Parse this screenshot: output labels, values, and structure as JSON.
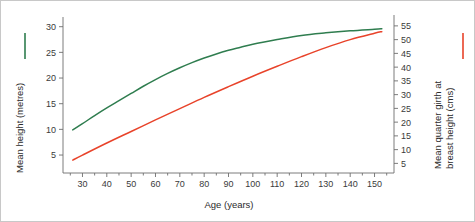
{
  "chart_data": {
    "type": "line",
    "title": "",
    "xlabel": "Age (years)",
    "xlim": [
      22,
      158
    ],
    "xticks": [
      30,
      40,
      50,
      60,
      70,
      80,
      90,
      100,
      110,
      120,
      130,
      140,
      150
    ],
    "grid": false,
    "legend_position": "axis-labels",
    "axes": [
      {
        "id": "left",
        "ylabel": "Mean height (metres)",
        "ylim": [
          1.5,
          31.5
        ],
        "yticks": [
          5,
          10,
          15,
          20,
          25,
          30
        ],
        "color": "#2f7d4f"
      },
      {
        "id": "right",
        "ylabel_line1": "Mean quarter girth at",
        "ylabel_line2": "breast height (cms)",
        "ylim": [
          1.5,
          57.5
        ],
        "yticks": [
          5,
          10,
          15,
          20,
          25,
          30,
          35,
          40,
          45,
          50,
          55
        ],
        "color": "#e8432a"
      }
    ],
    "series": [
      {
        "name": "Mean height (metres)",
        "axis": "left",
        "color": "#2f7d4f",
        "x": [
          26,
          30,
          35,
          40,
          45,
          50,
          55,
          60,
          65,
          70,
          75,
          80,
          85,
          90,
          95,
          100,
          110,
          120,
          130,
          140,
          150,
          153
        ],
        "values": [
          9.9,
          11.1,
          12.7,
          14.2,
          15.6,
          17.0,
          18.4,
          19.7,
          20.9,
          22.0,
          23.0,
          23.9,
          24.7,
          25.4,
          26.0,
          26.6,
          27.5,
          28.3,
          28.8,
          29.2,
          29.5,
          29.6
        ]
      },
      {
        "name": "Mean quarter girth at breast height (cms)",
        "axis": "right",
        "color": "#e8432a",
        "x": [
          26,
          30,
          40,
          50,
          60,
          70,
          80,
          90,
          100,
          110,
          120,
          130,
          140,
          150,
          153
        ],
        "values": [
          6.2,
          8.0,
          12.4,
          16.6,
          20.8,
          24.9,
          29.0,
          32.9,
          36.7,
          40.3,
          43.8,
          47.1,
          50.0,
          52.3,
          52.9
        ]
      }
    ],
    "annotations": {
      "crossover_age": 137,
      "crossover_left_value": 29.1,
      "crossover_right_value": 49.2
    },
    "legend": [
      {
        "label": "Mean height (metres)",
        "color": "#2f7d4f",
        "marker": "vertical-line",
        "side": "left"
      },
      {
        "label": "Mean quarter girth at breast height (cms)",
        "color": "#e8432a",
        "marker": "vertical-line",
        "side": "right"
      }
    ]
  }
}
